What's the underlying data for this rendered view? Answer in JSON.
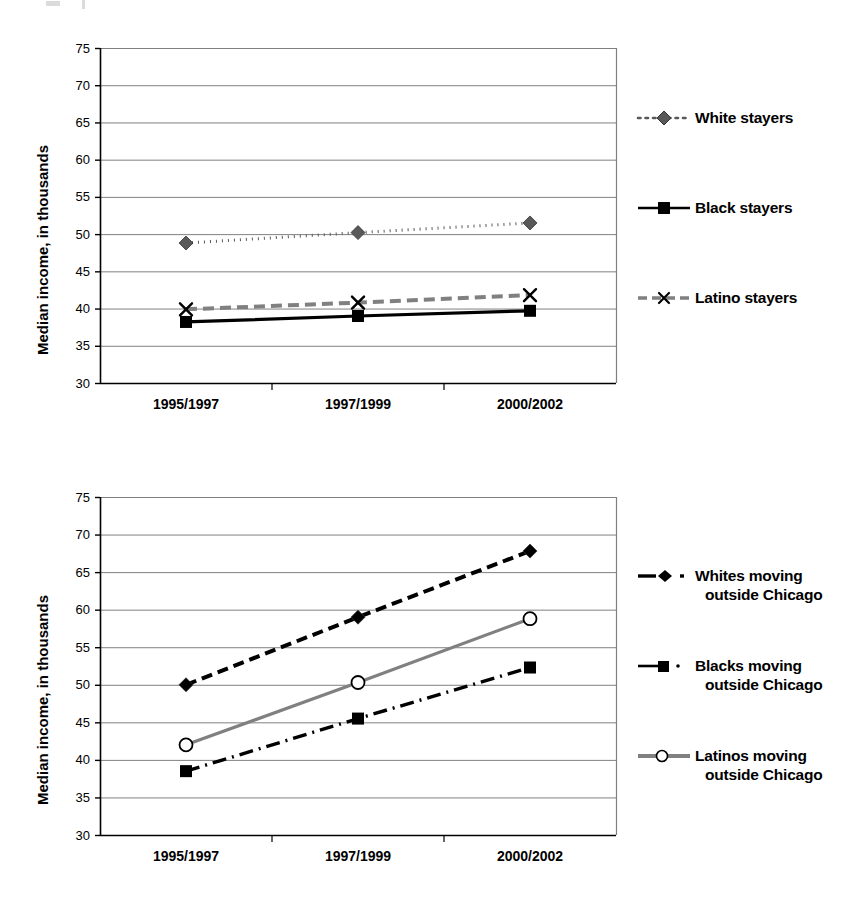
{
  "page": {
    "width": 866,
    "height": 909,
    "background": "#ffffff"
  },
  "colors": {
    "axis": "#000000",
    "gridline": "#808080",
    "series_black": "#000000",
    "series_gray": "#808080",
    "series_dark_gray": "#595959",
    "text": "#000000"
  },
  "charts": [
    {
      "id": "stayers",
      "axis": {
        "ylabel": "Median income, in thousands",
        "yticks": [
          "30",
          "35",
          "40",
          "45",
          "50",
          "55",
          "60",
          "65",
          "70",
          "75"
        ],
        "xticks": [
          "1995/1997",
          "1997/1999",
          "2000/2002"
        ]
      },
      "legend": [
        {
          "label": "White stayers",
          "marker": "diamond",
          "line": "dotted",
          "color": "#595959"
        },
        {
          "label": "Black stayers",
          "marker": "square",
          "line": "solid",
          "color": "#000000"
        },
        {
          "label": "Latino stayers",
          "marker": "x",
          "line": "dashed",
          "color": "#808080"
        }
      ],
      "chart_data": {
        "type": "line",
        "title": "",
        "xlabel": "",
        "ylabel": "Median income, in thousands",
        "categories": [
          "1995/1997",
          "1997/1999",
          "2000/2002"
        ],
        "ylim": [
          30,
          75
        ],
        "ytick_step": 5,
        "grid": true,
        "legend_position": "right",
        "series": [
          {
            "name": "White stayers",
            "values": [
              48.8,
              50.2,
              51.5
            ]
          },
          {
            "name": "Black stayers",
            "values": [
              38.2,
              39.0,
              39.7
            ]
          },
          {
            "name": "Latino stayers",
            "values": [
              39.9,
              40.8,
              41.8
            ]
          }
        ]
      }
    },
    {
      "id": "movers",
      "axis": {
        "ylabel": "Median income, in thousands",
        "yticks": [
          "30",
          "35",
          "40",
          "45",
          "50",
          "55",
          "60",
          "65",
          "70",
          "75"
        ],
        "xticks": [
          "1995/1997",
          "1997/1999",
          "2000/2002"
        ]
      },
      "legend": [
        {
          "label_line1": "Whites moving",
          "label_line2": "outside Chicago",
          "marker": "diamond",
          "line": "dashed",
          "color": "#000000"
        },
        {
          "label_line1": "Blacks moving",
          "label_line2": "outside Chicago",
          "marker": "square",
          "line": "dashdot",
          "color": "#000000"
        },
        {
          "label_line1": "Latinos moving",
          "label_line2": "outside Chicago",
          "marker": "circle-open",
          "line": "solid",
          "color": "#808080"
        }
      ],
      "chart_data": {
        "type": "line",
        "title": "",
        "xlabel": "",
        "ylabel": "Median income, in thousands",
        "categories": [
          "1995/1997",
          "1997/1999",
          "2000/2002"
        ],
        "ylim": [
          30,
          75
        ],
        "ytick_step": 5,
        "grid": true,
        "legend_position": "right",
        "series": [
          {
            "name": "Whites moving outside Chicago",
            "values": [
              50.0,
              59.0,
              67.8
            ]
          },
          {
            "name": "Blacks moving outside Chicago",
            "values": [
              38.5,
              45.5,
              52.3
            ]
          },
          {
            "name": "Latinos moving outside Chicago",
            "values": [
              42.0,
              50.3,
              58.8
            ]
          }
        ]
      }
    }
  ]
}
